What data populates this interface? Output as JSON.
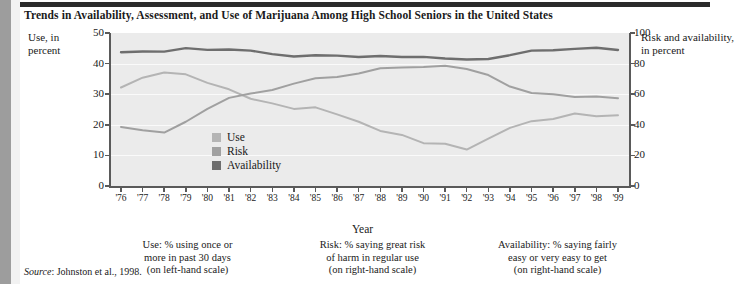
{
  "figure": {
    "title": "Trends in Availability, Assessment, and Use of Marijuana Among High School Seniors in the United States",
    "source_label": "Source",
    "source_text": ": Johnston et al., 1998."
  },
  "axes": {
    "left_label": "Use, in percent",
    "right_label": "Risk and availability, in percent",
    "x_title": "Year",
    "left_ticks": [
      "0",
      "10",
      "20",
      "30",
      "40",
      "50"
    ],
    "right_ticks": [
      "0",
      "20",
      "40",
      "60",
      "80",
      "100"
    ]
  },
  "legend": {
    "items": [
      {
        "label": "Use",
        "color": "#b4b4b4"
      },
      {
        "label": "Risk",
        "color": "#a0a0a0"
      },
      {
        "label": "Availability",
        "color": "#6e6e6e"
      }
    ]
  },
  "notes": [
    {
      "line1": "Use: % using once or",
      "line2": "more in past 30 days",
      "line3": "(on left-hand scale)"
    },
    {
      "line1": "Risk: % saying great risk",
      "line2": "of harm in regular use",
      "line3": "(on right-hand scale)"
    },
    {
      "line1": "Availability: % saying fairly",
      "line2": "easy or very easy to get",
      "line3": "(on right-hand scale)"
    }
  ],
  "chart_data": {
    "type": "line",
    "title": "Trends in Availability, Assessment, and Use of Marijuana Among High School Seniors in the United States",
    "xlabel": "Year",
    "ylabel": "Use, in percent",
    "ylabel_right": "Risk and availability, in percent",
    "grid": true,
    "legend_position": "inside-center-lower",
    "categories": [
      "'76",
      "'77",
      "'78",
      "'79",
      "'80",
      "'81",
      "'82",
      "'83",
      "'84",
      "'85",
      "'86",
      "'87",
      "'88",
      "'89",
      "'90",
      "'91",
      "'92",
      "'93",
      "'94",
      "'95",
      "'96",
      "'97",
      "'98",
      "'99"
    ],
    "x": [
      1976,
      1977,
      1978,
      1979,
      1980,
      1981,
      1982,
      1983,
      1984,
      1985,
      1986,
      1987,
      1988,
      1989,
      1990,
      1991,
      1992,
      1993,
      1994,
      1995,
      1996,
      1997,
      1998,
      1999
    ],
    "ylim_left": [
      0,
      50
    ],
    "ylim_right": [
      0,
      100
    ],
    "series": [
      {
        "name": "Use",
        "scale": "left",
        "units": "percent using once or more in past 30 days",
        "color": "#b4b4b4",
        "values": [
          32.2,
          35.4,
          37.1,
          36.5,
          33.7,
          31.6,
          28.5,
          27.0,
          25.2,
          25.7,
          23.4,
          21.0,
          18.0,
          16.7,
          14.0,
          13.8,
          11.9,
          15.5,
          19.0,
          21.2,
          21.9,
          23.7,
          22.8,
          23.1
        ],
        "line_values_right_scale": null
      },
      {
        "name": "Risk",
        "scale": "right",
        "units": "percent saying great risk of harm in regular use",
        "color": "#a0a0a0",
        "values": [
          38.6,
          36.4,
          34.9,
          42.0,
          50.4,
          57.6,
          60.4,
          62.8,
          66.9,
          70.4,
          71.3,
          73.5,
          77.0,
          77.5,
          77.8,
          78.6,
          76.5,
          72.5,
          65.0,
          60.8,
          59.9,
          58.1,
          58.5,
          57.4
        ],
        "line_values_right_scale": null
      },
      {
        "name": "Availability",
        "scale": "right",
        "units": "percent saying fairly easy or very easy to get",
        "color": "#6e6e6e",
        "values": [
          87.4,
          87.9,
          87.8,
          90.1,
          89.0,
          89.2,
          88.5,
          86.2,
          84.6,
          85.5,
          85.2,
          84.3,
          85.0,
          84.3,
          84.4,
          83.3,
          82.7,
          83.0,
          85.5,
          88.5,
          88.7,
          89.6,
          90.4,
          88.9
        ]
      }
    ]
  }
}
